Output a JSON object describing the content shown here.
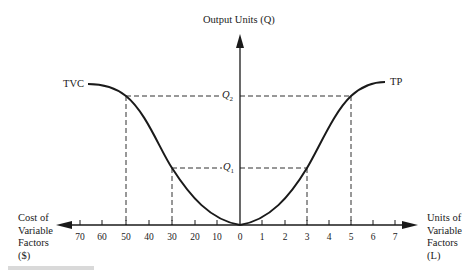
{
  "diagram": {
    "y_axis_label": "Output Units (Q)",
    "left_axis_label_lines": [
      "Cost of",
      "Variable",
      "Factors",
      "($)"
    ],
    "right_axis_label_lines": [
      "Units of",
      "Variable",
      "Factors",
      "(L)"
    ],
    "left_ticks": [
      "70",
      "60",
      "50",
      "40",
      "30",
      "20",
      "10"
    ],
    "origin_label": "0",
    "right_ticks": [
      "1",
      "2",
      "3",
      "4",
      "5",
      "6",
      "7"
    ],
    "curves": {
      "left": "TVC",
      "right": "TP"
    },
    "levels": {
      "q1": "Q",
      "q1_sub": "1",
      "q2": "Q",
      "q2_sub": "2"
    },
    "reference_points": [
      {
        "curve": "TVC",
        "cost": 50,
        "output": "Q2"
      },
      {
        "curve": "TVC",
        "cost": 30,
        "output": "Q1"
      },
      {
        "curve": "TP",
        "units": 3,
        "output": "Q1"
      },
      {
        "curve": "TP",
        "units": 5,
        "output": "Q2"
      }
    ],
    "colors": {
      "ink": "#1a1a1a",
      "background": "#ffffff"
    }
  }
}
